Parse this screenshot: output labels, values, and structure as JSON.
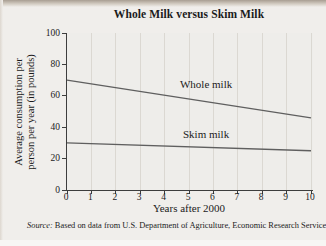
{
  "page": {
    "source_prefix": "Source:",
    "source_text": " Based on data from U.S. Department of Agriculture, Economic Research Service"
  },
  "chart_data": {
    "type": "line",
    "title": "Whole Milk versus Skim Milk",
    "xlabel": "Years after 2000",
    "ylabel": "Average consumption per person per year (in pounds)",
    "ylabel_lines": [
      "Average consumption per",
      "person per year (in pounds)"
    ],
    "xlim": [
      0,
      10
    ],
    "ylim": [
      0,
      100
    ],
    "x_ticks": [
      0,
      1,
      2,
      3,
      4,
      5,
      6,
      7,
      8,
      9,
      10
    ],
    "y_ticks": [
      0,
      20,
      40,
      60,
      80,
      100
    ],
    "grid": "vertical-only",
    "legend_position": "inline-labels",
    "series": [
      {
        "name": "Whole milk",
        "x": [
          0,
          10
        ],
        "values": [
          70,
          46
        ],
        "label_anchor": {
          "x": 5.7,
          "y": 64
        }
      },
      {
        "name": "Skim milk",
        "x": [
          0,
          10
        ],
        "values": [
          30,
          25
        ],
        "label_anchor": {
          "x": 5.7,
          "y": 32
        }
      }
    ],
    "line_color": "#5f5f5f",
    "axis_color": "#3d3d3d",
    "grid_color": "#dbd8d2",
    "text_color": "#1b1b1b"
  }
}
